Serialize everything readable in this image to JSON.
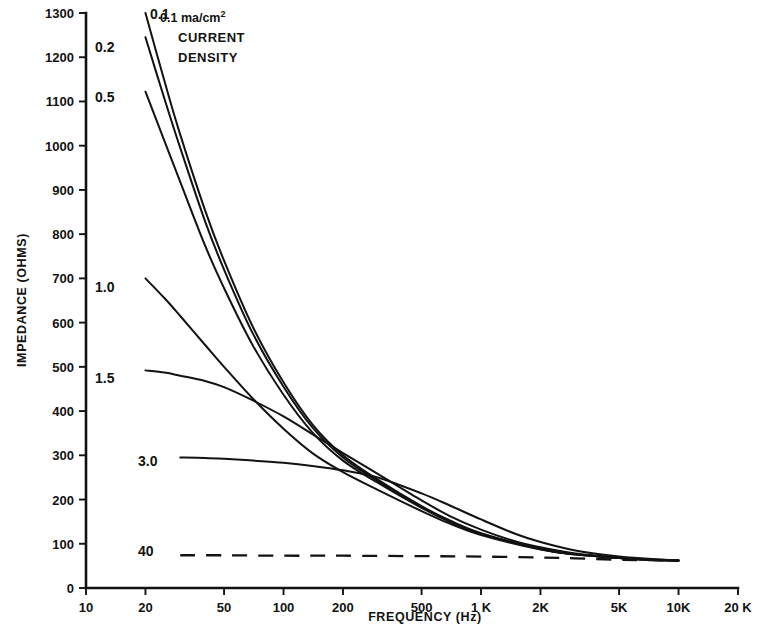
{
  "chart_data": {
    "type": "line",
    "title": "",
    "xlabel": "FREQUENCY  (Hz)",
    "ylabel": "IMPEDANCE  (OHMS)",
    "xscale": "log",
    "xlim": [
      10,
      20000
    ],
    "ylim": [
      0,
      1300
    ],
    "grid": false,
    "legend": "inline-curve-labels",
    "annotation": {
      "unit_value": "0.1",
      "unit": "ma/cm",
      "unit_exponent": "2",
      "line2": "CURRENT",
      "line3": "DENSITY"
    },
    "xticks": [
      {
        "value": 10,
        "label": "10"
      },
      {
        "value": 20,
        "label": "20"
      },
      {
        "value": 50,
        "label": "50"
      },
      {
        "value": 100,
        "label": "100"
      },
      {
        "value": 200,
        "label": "200"
      },
      {
        "value": 500,
        "label": "500"
      },
      {
        "value": 1000,
        "label": "1 K"
      },
      {
        "value": 2000,
        "label": "2K"
      },
      {
        "value": 5000,
        "label": "5K"
      },
      {
        "value": 10000,
        "label": "10K"
      },
      {
        "value": 20000,
        "label": "20 K"
      }
    ],
    "yticks": [
      {
        "value": 0,
        "label": "0"
      },
      {
        "value": 100,
        "label": "100"
      },
      {
        "value": 200,
        "label": "200"
      },
      {
        "value": 300,
        "label": "300"
      },
      {
        "value": 400,
        "label": "400"
      },
      {
        "value": 500,
        "label": "500"
      },
      {
        "value": 600,
        "label": "600"
      },
      {
        "value": 700,
        "label": "700"
      },
      {
        "value": 800,
        "label": "800"
      },
      {
        "value": 900,
        "label": "900"
      },
      {
        "value": 1000,
        "label": "1000"
      },
      {
        "value": 1100,
        "label": "1100"
      },
      {
        "value": 1200,
        "label": "1200"
      },
      {
        "value": 1300,
        "label": "1300"
      }
    ],
    "series": [
      {
        "name": "0.1",
        "label": "0.1",
        "style": "solid",
        "label_pos": {
          "x": 150,
          "y": 14
        },
        "points": [
          [
            20,
            1300
          ],
          [
            25,
            1145
          ],
          [
            30,
            1025
          ],
          [
            40,
            855
          ],
          [
            50,
            740
          ],
          [
            70,
            590
          ],
          [
            100,
            465
          ],
          [
            140,
            370
          ],
          [
            200,
            300
          ],
          [
            300,
            245
          ],
          [
            500,
            185
          ],
          [
            700,
            152
          ],
          [
            1000,
            124
          ],
          [
            2000,
            88
          ],
          [
            3000,
            76
          ],
          [
            5000,
            68
          ],
          [
            7000,
            64
          ],
          [
            10000,
            62
          ]
        ]
      },
      {
        "name": "0.2",
        "label": "0.2",
        "style": "solid",
        "label_pos": {
          "x": 95,
          "y": 47
        },
        "points": [
          [
            20,
            1245
          ],
          [
            25,
            1105
          ],
          [
            30,
            995
          ],
          [
            40,
            830
          ],
          [
            50,
            720
          ],
          [
            70,
            575
          ],
          [
            100,
            455
          ],
          [
            140,
            363
          ],
          [
            200,
            295
          ],
          [
            300,
            242
          ],
          [
            500,
            183
          ],
          [
            700,
            150
          ],
          [
            1000,
            123
          ],
          [
            2000,
            88
          ],
          [
            3000,
            76
          ],
          [
            5000,
            68
          ],
          [
            7000,
            64
          ],
          [
            10000,
            62
          ]
        ]
      },
      {
        "name": "0.5",
        "label": "0.5",
        "style": "solid",
        "label_pos": {
          "x": 95,
          "y": 97
        },
        "points": [
          [
            20,
            1122
          ],
          [
            25,
            1010
          ],
          [
            30,
            918
          ],
          [
            40,
            775
          ],
          [
            50,
            678
          ],
          [
            70,
            548
          ],
          [
            100,
            437
          ],
          [
            140,
            352
          ],
          [
            200,
            288
          ],
          [
            300,
            238
          ],
          [
            500,
            181
          ],
          [
            700,
            149
          ],
          [
            1000,
            122
          ],
          [
            2000,
            88
          ],
          [
            3000,
            76
          ],
          [
            5000,
            68
          ],
          [
            7000,
            64
          ],
          [
            10000,
            62
          ]
        ]
      },
      {
        "name": "1.0",
        "label": "1.0",
        "style": "solid",
        "label_pos": {
          "x": 95,
          "y": 287
        },
        "points": [
          [
            20,
            700
          ],
          [
            25,
            655
          ],
          [
            30,
            615
          ],
          [
            40,
            550
          ],
          [
            50,
            500
          ],
          [
            70,
            428
          ],
          [
            100,
            360
          ],
          [
            140,
            305
          ],
          [
            200,
            262
          ],
          [
            300,
            222
          ],
          [
            500,
            174
          ],
          [
            700,
            145
          ],
          [
            1000,
            120
          ],
          [
            2000,
            87
          ],
          [
            3000,
            76
          ],
          [
            5000,
            68
          ],
          [
            7000,
            64
          ],
          [
            10000,
            62
          ]
        ]
      },
      {
        "name": "1.5",
        "label": "1.5",
        "style": "solid",
        "label_pos": {
          "x": 95,
          "y": 378
        },
        "points": [
          [
            20,
            492
          ],
          [
            25,
            487
          ],
          [
            30,
            480
          ],
          [
            40,
            468
          ],
          [
            50,
            454
          ],
          [
            70,
            424
          ],
          [
            100,
            388
          ],
          [
            140,
            348
          ],
          [
            200,
            305
          ],
          [
            300,
            258
          ],
          [
            500,
            198
          ],
          [
            700,
            162
          ],
          [
            1000,
            132
          ],
          [
            1500,
            105
          ],
          [
            2000,
            92
          ],
          [
            3000,
            78
          ],
          [
            5000,
            69
          ],
          [
            7000,
            65
          ],
          [
            10000,
            62
          ]
        ]
      },
      {
        "name": "3.0",
        "label": "3.0",
        "style": "solid",
        "label_pos": {
          "x": 138,
          "y": 461
        },
        "points": [
          [
            30,
            295
          ],
          [
            40,
            294
          ],
          [
            50,
            292
          ],
          [
            70,
            288
          ],
          [
            100,
            283
          ],
          [
            140,
            276
          ],
          [
            200,
            266
          ],
          [
            300,
            250
          ],
          [
            500,
            214
          ],
          [
            700,
            186
          ],
          [
            1000,
            155
          ],
          [
            1500,
            122
          ],
          [
            2000,
            104
          ],
          [
            3000,
            85
          ],
          [
            5000,
            71
          ],
          [
            7000,
            66
          ],
          [
            10000,
            62
          ]
        ]
      },
      {
        "name": "40",
        "label": "40",
        "style": "dashed",
        "label_pos": {
          "x": 138,
          "y": 551
        },
        "points": [
          [
            30,
            74
          ],
          [
            50,
            74
          ],
          [
            100,
            73
          ],
          [
            200,
            73
          ],
          [
            500,
            72
          ],
          [
            1000,
            71
          ],
          [
            2000,
            69
          ],
          [
            3000,
            67
          ],
          [
            5000,
            64
          ],
          [
            7000,
            63
          ],
          [
            10000,
            62
          ]
        ]
      }
    ]
  }
}
